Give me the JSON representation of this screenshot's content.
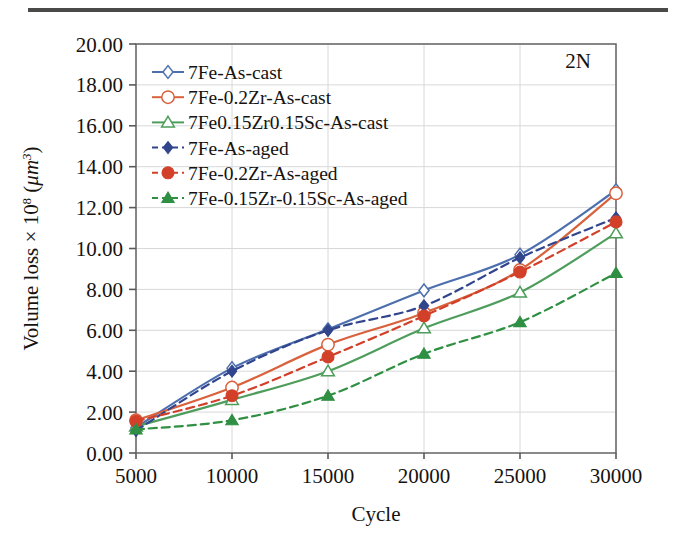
{
  "figure": {
    "annotation": "2N",
    "top_rule": true
  },
  "chart_data": {
    "type": "line",
    "title": "",
    "xlabel": "Cycle",
    "ylabel": "Volume loss × 10⁸ (μm³)",
    "ylabel_parts": {
      "prefix": "Volume loss × 10",
      "exponent": "8",
      "unit_open": " (",
      "unit_mu": "μm",
      "unit_exp": "3",
      "unit_close": ")"
    },
    "x": [
      5000,
      10000,
      15000,
      20000,
      25000,
      30000
    ],
    "xtick_labels": [
      "5000",
      "10000",
      "15000",
      "20000",
      "25000",
      "30000"
    ],
    "xlim": [
      5000,
      30000
    ],
    "ylim": [
      0,
      20
    ],
    "ytick_labels": [
      "0.00",
      "2.00",
      "4.00",
      "6.00",
      "8.00",
      "10.00",
      "12.00",
      "14.00",
      "16.00",
      "18.00",
      "20.00"
    ],
    "ytick_values": [
      0,
      2,
      4,
      6,
      8,
      10,
      12,
      14,
      16,
      18,
      20
    ],
    "grid": true,
    "legend_position": "top-left",
    "annotation": "2N",
    "series": [
      {
        "name": "7Fe-As-cast",
        "color": "#4d6fae",
        "marker": "diamond-open",
        "linestyle": "solid",
        "values": [
          1.25,
          4.15,
          6.05,
          7.95,
          9.7,
          12.85
        ]
      },
      {
        "name": "7Fe-0.2Zr-As-cast",
        "color": "#d9613c",
        "marker": "circle-open",
        "linestyle": "solid",
        "values": [
          1.6,
          3.2,
          5.3,
          6.85,
          8.95,
          12.7
        ]
      },
      {
        "name": "7Fe0.15Zr0.15Sc-As-cast",
        "color": "#4e9d5c",
        "marker": "triangle-open",
        "linestyle": "solid",
        "values": [
          1.3,
          2.6,
          4.0,
          6.1,
          7.85,
          10.75
        ]
      },
      {
        "name": "7Fe-As-aged",
        "color": "#31458c",
        "marker": "diamond-filled",
        "linestyle": "dashed",
        "values": [
          1.1,
          4.0,
          6.0,
          7.2,
          9.55,
          11.5
        ]
      },
      {
        "name": "7Fe-0.2Zr-As-aged",
        "color": "#d2402a",
        "marker": "circle-filled",
        "linestyle": "dashed",
        "values": [
          1.55,
          2.8,
          4.7,
          6.7,
          8.85,
          11.3
        ]
      },
      {
        "name": "7Fe-0.15Zr-0.15Sc-As-aged",
        "color": "#2f8f42",
        "marker": "triangle-filled",
        "linestyle": "dashed",
        "values": [
          1.15,
          1.6,
          2.8,
          4.85,
          6.4,
          8.8
        ]
      }
    ]
  }
}
